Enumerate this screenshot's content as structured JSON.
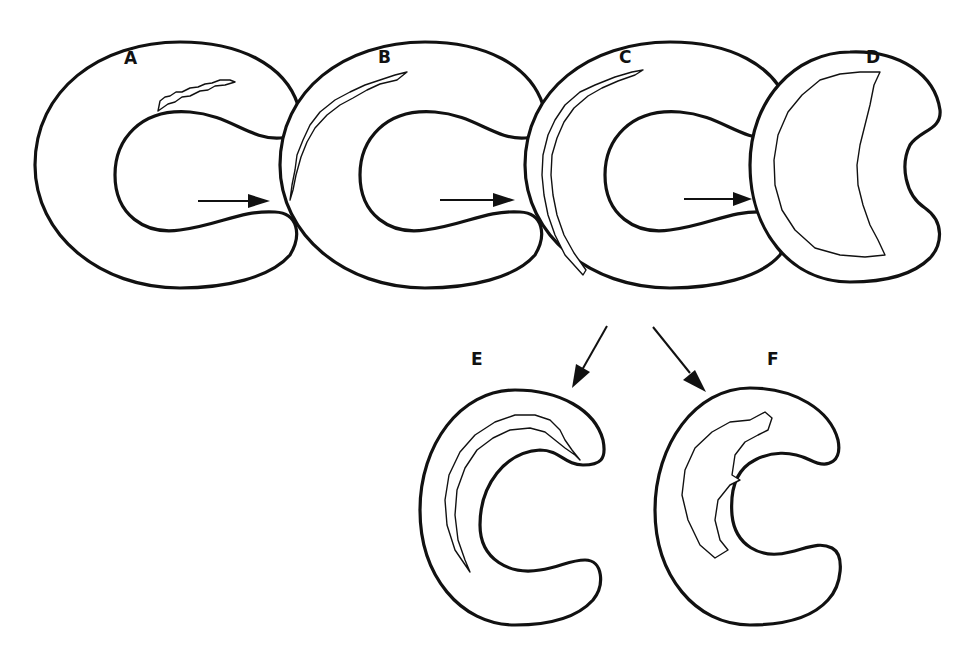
{
  "figure": {
    "type": "diagram",
    "stages": [
      {
        "id": "A",
        "label": "A"
      },
      {
        "id": "B",
        "label": "B"
      },
      {
        "id": "C",
        "label": "C"
      },
      {
        "id": "D",
        "label": "D"
      },
      {
        "id": "E",
        "label": "E"
      },
      {
        "id": "F",
        "label": "F"
      }
    ],
    "arrows": [
      {
        "from": "A",
        "to": "B"
      },
      {
        "from": "B",
        "to": "C"
      },
      {
        "from": "C",
        "to": "D"
      },
      {
        "from": "C",
        "to": "E"
      },
      {
        "from": "C",
        "to": "F"
      }
    ],
    "colors": {
      "stroke": "#111111",
      "background": "#ffffff"
    }
  }
}
